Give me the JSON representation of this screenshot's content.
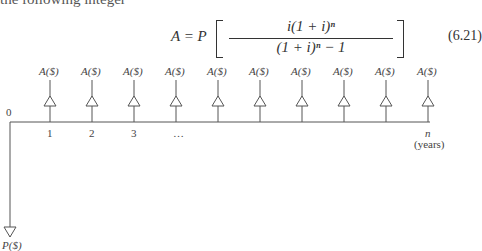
{
  "top_text": "the following integer",
  "equation": {
    "lhs": "A = P",
    "numerator": "i(1 + i)ⁿ",
    "denominator": "(1 + i)ⁿ − 1",
    "number": "(6.21)"
  },
  "diagram": {
    "origin_label": "0",
    "period_labels": [
      "1",
      "2",
      "3",
      "…",
      "n"
    ],
    "end_label": "(years)",
    "payment_label": "A($)",
    "payment_count": 10,
    "principal_label": "P($)"
  }
}
